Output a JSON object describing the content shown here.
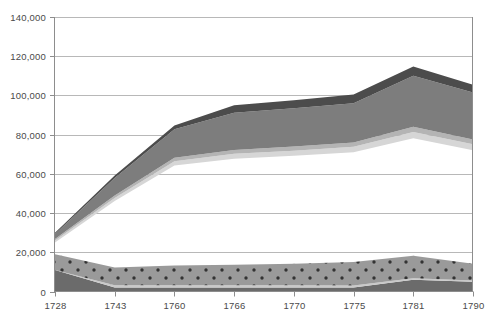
{
  "chart_data": {
    "type": "area",
    "title": "",
    "subtitle": "",
    "xlabel": "",
    "ylabel": "",
    "categories": [
      "1728",
      "1743",
      "1760",
      "1766",
      "1770",
      "1775",
      "1781",
      "1790"
    ],
    "x_tick_labels": [
      "1728",
      "1743",
      "1760",
      "1766",
      "1770",
      "1775",
      "1781",
      "1790"
    ],
    "y_tick_labels": [
      "0",
      "20,000",
      "40,000",
      "60,000",
      "80,000",
      "100,000",
      "120,000",
      "140,000"
    ],
    "y_tick_values": [
      0,
      20000,
      40000,
      60000,
      80000,
      100000,
      120000,
      140000
    ],
    "ylim": [
      0,
      140000
    ],
    "grid": "horizontal",
    "legend": "none",
    "stacking": "grouped-bands",
    "series": [
      {
        "name": "band-1-dark-lower",
        "order": 1,
        "color": "#6b6b6b",
        "pattern": "solid",
        "values": [
          11000,
          2000,
          2000,
          2000,
          2000,
          2000,
          6000,
          5000
        ]
      },
      {
        "name": "band-2-light-stripe",
        "order": 2,
        "color": "#c9c9c9",
        "pattern": "solid",
        "values": [
          0,
          1200,
          1200,
          1200,
          1200,
          1000,
          700,
          600
        ]
      },
      {
        "name": "band-3-dotted",
        "order": 3,
        "color": "#9a9a9a",
        "pattern": "polka-dot",
        "values": [
          8000,
          9000,
          10000,
          10500,
          11000,
          12000,
          11500,
          8500
        ]
      },
      {
        "name": "band-4-gap",
        "order": 4,
        "color": "#ffffff",
        "pattern": "none",
        "values": [
          6000,
          34000,
          51000,
          54000,
          55000,
          56000,
          60000,
          58000
        ]
      },
      {
        "name": "band-5-pale",
        "order": 5,
        "color": "#d6d6d6",
        "pattern": "solid",
        "values": [
          1000,
          1500,
          2200,
          2500,
          2600,
          2800,
          3200,
          3000
        ]
      },
      {
        "name": "band-6-mid",
        "order": 6,
        "color": "#b4b4b4",
        "pattern": "solid",
        "values": [
          800,
          1200,
          1800,
          2000,
          2100,
          2200,
          2600,
          2400
        ]
      },
      {
        "name": "band-7-main",
        "order": 7,
        "color": "#7d7d7d",
        "pattern": "solid",
        "values": [
          2500,
          9000,
          14500,
          19000,
          19500,
          20000,
          26000,
          24000
        ]
      },
      {
        "name": "band-8-dark-top",
        "order": 8,
        "color": "#4c4c4c",
        "pattern": "solid",
        "values": [
          600,
          1300,
          2000,
          3800,
          4100,
          4500,
          4700,
          4000
        ]
      }
    ],
    "cumulative_top_values": [
      30900,
      59200,
      84200,
      95000,
      97500,
      100500,
      114700,
      105500
    ]
  },
  "axes": {
    "y_title": "",
    "x_title": ""
  }
}
